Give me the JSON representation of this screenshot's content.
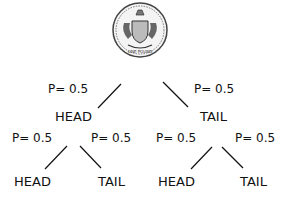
{
  "diagram": {
    "root": {
      "label": "coin",
      "icon": "coin-icon"
    },
    "level1": [
      {
        "node": "HEAD",
        "prob": "P= 0.5"
      },
      {
        "node": "TAIL",
        "prob": "P= 0.5"
      }
    ],
    "level2": [
      {
        "node": "HEAD",
        "prob": "P= 0.5"
      },
      {
        "node": "TAIL",
        "prob": "P= 0.5"
      },
      {
        "node": "HEAD",
        "prob": "P= 0.5"
      },
      {
        "node": "TAIL",
        "prob": "P= 0.5"
      }
    ],
    "coin_text": "ONE POUND"
  }
}
